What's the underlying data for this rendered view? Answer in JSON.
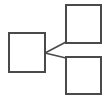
{
  "diagram": {
    "title": "",
    "background_color": "#ffffff",
    "stroke_color": "#4a4a4a",
    "stroke_width": 1.7,
    "canvas": {
      "width": 107,
      "height": 98
    },
    "nodes": [
      {
        "id": "source-node",
        "label": "",
        "role": "source",
        "x": 9,
        "y": 33,
        "width": 36,
        "height": 39,
        "fill": "#ffffff",
        "stroke": "#4a4a4a"
      },
      {
        "id": "target-node-top",
        "label": "",
        "role": "target",
        "x": 66,
        "y": 5,
        "width": 35,
        "height": 38,
        "fill": "#ffffff",
        "stroke": "#4a4a4a"
      },
      {
        "id": "target-node-bottom",
        "label": "",
        "role": "target",
        "x": 66,
        "y": 57,
        "width": 35,
        "height": 37,
        "fill": "#ffffff",
        "stroke": "#4a4a4a"
      }
    ],
    "connectors": [
      {
        "id": "connector-to-top",
        "from": "source-node",
        "to": "target-node-top",
        "label": "",
        "x1": 45,
        "y1": 53,
        "x2": 66,
        "y2": 42,
        "stroke": "#4a4a4a"
      },
      {
        "id": "connector-to-bottom",
        "from": "source-node",
        "to": "target-node-bottom",
        "label": "",
        "x1": 45,
        "y1": 53,
        "x2": 66,
        "y2": 58,
        "stroke": "#4a4a4a"
      }
    ]
  }
}
